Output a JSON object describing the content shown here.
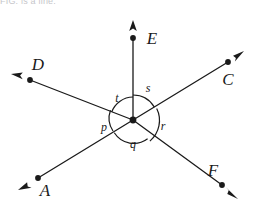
{
  "caption": {
    "text": "FIG. is a line."
  },
  "figure": {
    "stroke_color": "#1a1a1a",
    "background_color": "#ffffff",
    "vertex": {
      "name": "center-vertex",
      "x": 133,
      "y": 120
    },
    "rays": [
      {
        "id": "E",
        "label": "E",
        "label_x": 152,
        "label_y": 44,
        "dot_x": 133,
        "dot_y": 38,
        "tip_x": 133,
        "tip_y": 22,
        "direction": "up"
      },
      {
        "id": "D",
        "label": "D",
        "label_x": 38,
        "label_y": 70,
        "dot_x": 30,
        "dot_y": 80,
        "tip_x": 13,
        "tip_y": 75,
        "direction": "upper-left"
      },
      {
        "id": "C",
        "label": "C",
        "label_x": 228,
        "label_y": 85,
        "dot_x": 228,
        "dot_y": 62,
        "tip_x": 243,
        "tip_y": 52,
        "direction": "upper-right"
      },
      {
        "id": "A",
        "label": "A",
        "label_x": 45,
        "label_y": 196,
        "dot_x": 38,
        "dot_y": 178,
        "tip_x": 20,
        "tip_y": 189,
        "direction": "lower-left"
      },
      {
        "id": "F",
        "label": "F",
        "label_x": 213,
        "label_y": 176,
        "dot_x": 222,
        "dot_y": 185,
        "tip_x": 236,
        "tip_y": 197,
        "direction": "lower-right"
      }
    ],
    "lines": [
      {
        "id": "DF",
        "from": "D",
        "through": "vertex",
        "to": "F"
      },
      {
        "id": "AC",
        "from": "A",
        "through": "vertex",
        "to": "C"
      }
    ],
    "angles": [
      {
        "id": "t",
        "label": "t",
        "label_x": 117,
        "label_y": 102,
        "between": "D-ray and E-ray"
      },
      {
        "id": "s",
        "label": "s",
        "label_x": 148,
        "label_y": 92,
        "between": "E-ray and C-ray"
      },
      {
        "id": "r",
        "label": "r",
        "label_x": 163,
        "label_y": 130,
        "between": "C-ray and F-ray"
      },
      {
        "id": "q",
        "label": "q",
        "label_x": 133,
        "label_y": 148,
        "between": "F-ray and A-ray"
      },
      {
        "id": "p",
        "label": "p",
        "label_x": 104,
        "label_y": 131,
        "between": "A-ray and D-ray"
      }
    ]
  }
}
